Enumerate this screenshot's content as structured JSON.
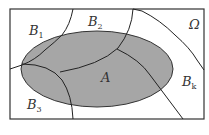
{
  "diagram": {
    "type": "venn-partition",
    "universe_label": "Ω",
    "event_label": "A",
    "partition_labels": [
      {
        "base": "B",
        "sub": "1"
      },
      {
        "base": "B",
        "sub": "2"
      },
      {
        "base": "B",
        "sub": "3"
      },
      {
        "base": "B",
        "sub": "k"
      }
    ],
    "colors": {
      "border": "#333333",
      "ellipse_fill": "#a6a6a6",
      "background": "#ffffff"
    }
  }
}
